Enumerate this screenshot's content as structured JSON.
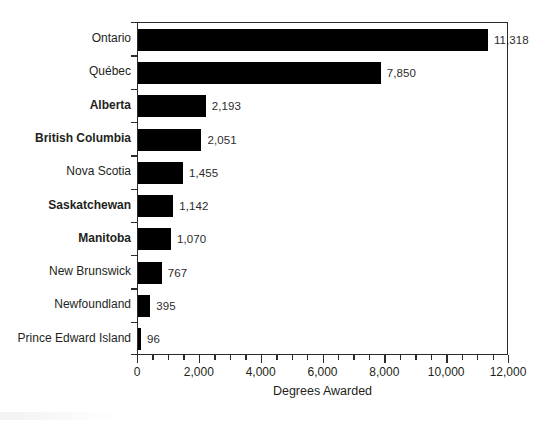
{
  "chart_data": {
    "type": "bar",
    "orientation": "horizontal",
    "title": "",
    "xlabel": "Degrees Awarded",
    "ylabel": "",
    "xlim": [
      0,
      12000
    ],
    "grid": false,
    "legend": null,
    "x_major_tick_step": 2000,
    "x_minor_tick_step": 500,
    "x_tick_labels": [
      "0",
      "2,000",
      "4,000",
      "6,000",
      "8,000",
      "10,000",
      "12,000"
    ],
    "x_tick_values": [
      0,
      2000,
      4000,
      6000,
      8000,
      10000,
      12000
    ],
    "bar_color": "#000000",
    "categories": [
      "Ontario",
      "Québec",
      "Alberta",
      "British Columbia",
      "Nova Scotia",
      "Saskatchewan",
      "Manitoba",
      "New Brunswick",
      "Newfoundland",
      "Prince Edward Island"
    ],
    "values": [
      11318,
      7850,
      2193,
      2051,
      1455,
      1142,
      1070,
      767,
      395,
      96
    ],
    "value_labels": [
      "11,318",
      "7,850",
      "2,193",
      "2,051",
      "1,455",
      "1,142",
      "1,070",
      "767",
      "395",
      "96"
    ],
    "emphasized_categories": [
      "Alberta",
      "British Columbia",
      "Saskatchewan",
      "Manitoba"
    ]
  }
}
